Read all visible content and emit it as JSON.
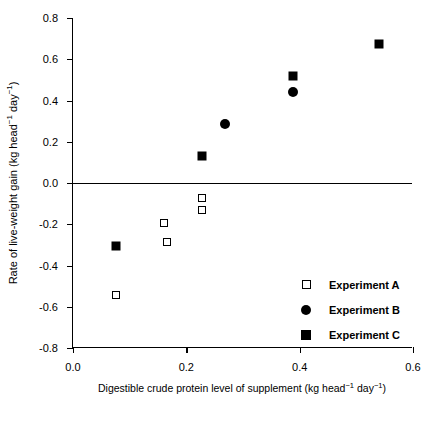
{
  "chart_data": {
    "type": "scatter",
    "title": "",
    "xlabel": "Digestible crude protein level of supplement (kg head⁻¹ day⁻¹)",
    "ylabel": "Rate of live-weight gain (kg head⁻¹ day⁻¹)",
    "xlim": [
      0.0,
      0.6
    ],
    "ylim": [
      -0.8,
      0.8
    ],
    "xticks": [
      "0.0",
      "0.2",
      "0.4",
      "0.6"
    ],
    "xtick_values": [
      0.0,
      0.2,
      0.4,
      0.6
    ],
    "yticks": [
      "0.8",
      "0.6",
      "0.4",
      "0.2",
      "0.0",
      "-0.2",
      "-0.4",
      "-0.6",
      "-0.8"
    ],
    "ytick_values": [
      0.8,
      0.6,
      0.4,
      0.2,
      0.0,
      -0.2,
      -0.4,
      -0.6,
      -0.8
    ],
    "grid": false,
    "zero_line": true,
    "legend_position": "inside-lower-right",
    "series": [
      {
        "name": "Experiment A",
        "marker": "open-square",
        "points": [
          {
            "x": 0.075,
            "y": -0.545
          },
          {
            "x": 0.16,
            "y": -0.195
          },
          {
            "x": 0.166,
            "y": -0.285
          },
          {
            "x": 0.228,
            "y": -0.075
          },
          {
            "x": 0.228,
            "y": -0.13
          }
        ]
      },
      {
        "name": "Experiment B",
        "marker": "filled-circle",
        "points": [
          {
            "x": 0.268,
            "y": 0.288
          },
          {
            "x": 0.388,
            "y": 0.44
          }
        ]
      },
      {
        "name": "Experiment C",
        "marker": "filled-square",
        "points": [
          {
            "x": 0.075,
            "y": -0.305
          },
          {
            "x": 0.228,
            "y": 0.13
          },
          {
            "x": 0.388,
            "y": 0.52
          },
          {
            "x": 0.54,
            "y": 0.672
          }
        ]
      }
    ]
  },
  "legend": {
    "items": [
      {
        "label": "Experiment A",
        "marker": "open-square"
      },
      {
        "label": "Experiment B",
        "marker": "filled-circle"
      },
      {
        "label": "Experiment C",
        "marker": "filled-square"
      }
    ]
  },
  "axis_titles": {
    "x_prefix": "Digestible crude protein level of supplement (kg head",
    "x_sup1": "−1",
    "x_mid": " day",
    "x_sup2": "−1",
    "x_suffix": ")",
    "y_prefix": "Rate of live-weight gain (kg head",
    "y_sup1": "−1",
    "y_mid": " day",
    "y_sup2": "−1",
    "y_suffix": ")"
  }
}
